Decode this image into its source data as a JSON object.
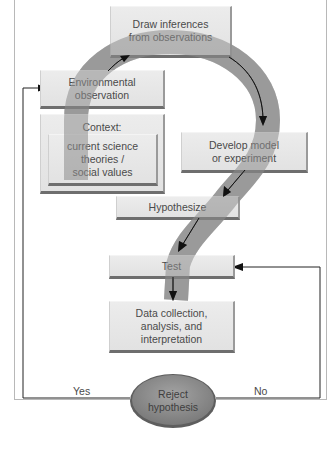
{
  "diagram": {
    "nodes": {
      "draw_inferences": "Draw inferences from observations",
      "draw_inferences_l1": "Draw inferences",
      "draw_inferences_l2": "from observations",
      "environmental_observation_l1": "Environmental",
      "environmental_observation_l2": "observation",
      "context_title": "Context:",
      "context_l1": "current science",
      "context_l2": "theories /",
      "context_l3": "social values",
      "develop_model_l1": "Develop model",
      "develop_model_l2": "or experiment",
      "hypothesize": "Hypothesize",
      "test": "Test",
      "data_l1": "Data collection,",
      "data_l2": "analysis, and",
      "data_l3": "interpretation",
      "reject_l1": "Reject",
      "reject_l2": "hypothesis"
    },
    "edge_labels": {
      "yes": "Yes",
      "no": "No"
    },
    "colors": {
      "question_mark_band": "#9a9a9a",
      "box_fill": "#e6e6e6",
      "oval_fill": "#8f8f8f",
      "arrow": "#111111"
    }
  }
}
